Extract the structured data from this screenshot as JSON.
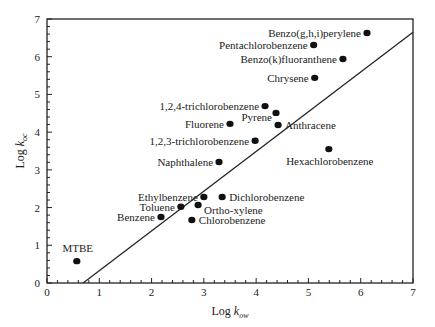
{
  "chart_data": {
    "type": "scatter",
    "title": "",
    "xlabel": "Log k_ow",
    "ylabel": "Log k_oc",
    "xlabel_parts": {
      "main": "Log ",
      "var": "k",
      "sub": "ow"
    },
    "ylabel_parts": {
      "main": "Log ",
      "var": "k",
      "sub": "oc"
    },
    "xlim": [
      0,
      7
    ],
    "ylim": [
      0,
      7
    ],
    "xticks": [
      0,
      1,
      2,
      3,
      4,
      5,
      6,
      7
    ],
    "yticks": [
      0,
      1,
      2,
      3,
      4,
      5,
      6,
      7
    ],
    "grid": false,
    "legend": null,
    "points": [
      {
        "label": "Benzo(g,h,i)perylene",
        "x": 6.12,
        "y": 6.63,
        "label_pos": "left"
      },
      {
        "label": "Pentachlorobenzene",
        "x": 5.1,
        "y": 6.31,
        "label_pos": "left"
      },
      {
        "label": "Benzo(k)fluoranthene",
        "x": 5.66,
        "y": 5.94,
        "label_pos": "left"
      },
      {
        "label": "Chrysene",
        "x": 5.12,
        "y": 5.44,
        "label_pos": "left"
      },
      {
        "label": "1,2,4-trichlorobenzene",
        "x": 4.17,
        "y": 4.69,
        "label_pos": "left"
      },
      {
        "label": "Pyrene",
        "x": 4.38,
        "y": 4.51,
        "label_pos": "left-below"
      },
      {
        "label": "Anthracene",
        "x": 4.42,
        "y": 4.19,
        "label_pos": "right"
      },
      {
        "label": "Fluorene",
        "x": 3.5,
        "y": 4.22,
        "label_pos": "left"
      },
      {
        "label": "1,2,3-trichlorobenzene",
        "x": 3.98,
        "y": 3.77,
        "label_pos": "left"
      },
      {
        "label": "Naphthalene",
        "x": 3.29,
        "y": 3.21,
        "label_pos": "left"
      },
      {
        "label": "Hexachlorobenzene",
        "x": 5.39,
        "y": 3.55,
        "label_pos": "below"
      },
      {
        "label": "Ethylbenzene",
        "x": 3.0,
        "y": 2.28,
        "label_pos": "left"
      },
      {
        "label": "Dichlorobenzene",
        "x": 3.35,
        "y": 2.28,
        "label_pos": "right"
      },
      {
        "label": "Toluene",
        "x": 2.56,
        "y": 2.02,
        "label_pos": "left"
      },
      {
        "label": "Ortho-xylene",
        "x": 2.89,
        "y": 2.07,
        "label_pos": "right-below"
      },
      {
        "label": "Benzene",
        "x": 2.18,
        "y": 1.75,
        "label_pos": "left"
      },
      {
        "label": "Chlorobenzene",
        "x": 2.77,
        "y": 1.67,
        "label_pos": "right"
      },
      {
        "label": "MTBE",
        "x": 0.57,
        "y": 0.58,
        "label_pos": "above"
      }
    ],
    "regression_line": {
      "x": [
        0.69,
        7.0
      ],
      "y": [
        0.0,
        6.65
      ]
    }
  }
}
